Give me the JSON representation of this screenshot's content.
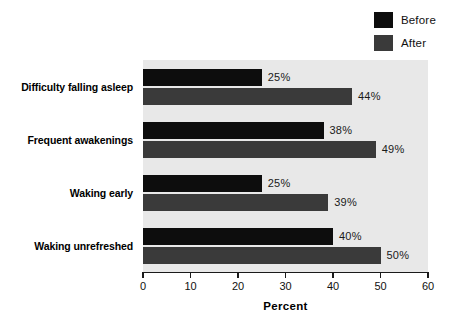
{
  "chart_data": {
    "type": "bar",
    "orientation": "horizontal",
    "title": "",
    "subtitle": "",
    "xlabel": "Percent",
    "ylabel": "",
    "xlim": [
      0,
      60
    ],
    "xticks": [
      0,
      10,
      20,
      30,
      40,
      50,
      60
    ],
    "xtick_labels": [
      "0",
      "10",
      "20",
      "30",
      "40",
      "50",
      "60"
    ],
    "grid": false,
    "legend_position": "top-right",
    "categories": [
      "Difficulty falling asleep",
      "Frequent awakenings",
      "Waking early",
      "Waking unrefreshed"
    ],
    "series": [
      {
        "name": "Before",
        "color": "#0d0d0d",
        "values": [
          25,
          38,
          25,
          40
        ],
        "value_labels": [
          "25%",
          "38%",
          "25%",
          "40%"
        ]
      },
      {
        "name": "After",
        "color": "#3a3a3a",
        "values": [
          44,
          49,
          39,
          50
        ],
        "value_labels": [
          "44%",
          "49%",
          "39%",
          "50%"
        ]
      }
    ],
    "plot_background": "#e8e8e8",
    "page_background": "#ffffff"
  },
  "legend": {
    "items": [
      {
        "label": "Before",
        "color": "#0d0d0d",
        "swatch_name": "legend-swatch-before"
      },
      {
        "label": "After",
        "color": "#3a3a3a",
        "swatch_name": "legend-swatch-after"
      }
    ]
  },
  "axis": {
    "title": "Percent"
  }
}
